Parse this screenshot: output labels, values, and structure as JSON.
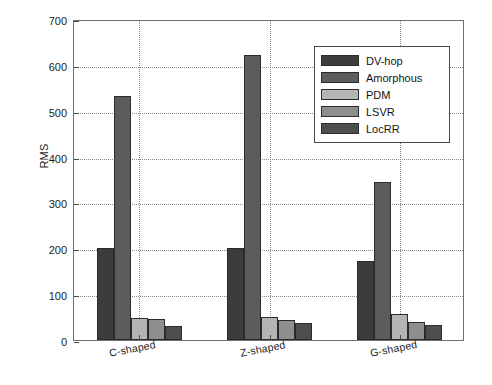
{
  "chart_data": {
    "type": "bar",
    "title": "",
    "xlabel": "",
    "ylabel": "RMS",
    "categories": [
      "C-shaped",
      "Z-shaped",
      "G-shaped"
    ],
    "series": [
      {
        "name": "DV-hop",
        "color": "#3c3c3c",
        "values": [
          201,
          201,
          172
        ]
      },
      {
        "name": "Amorphous",
        "color": "#5c5c5c",
        "values": [
          533,
          622,
          344
        ]
      },
      {
        "name": "PDM",
        "color": "#b4b4b4",
        "values": [
          48,
          51,
          57
        ]
      },
      {
        "name": "LSVR",
        "color": "#8e8e8e",
        "values": [
          45,
          44,
          39
        ]
      },
      {
        "name": "LocRR",
        "color": "#4e4e4e",
        "values": [
          30,
          38,
          32
        ]
      }
    ],
    "ylim": [
      0,
      700
    ],
    "yticks": [
      0,
      100,
      200,
      300,
      400,
      500,
      600,
      700
    ],
    "ytick_labels": [
      "0",
      "100",
      "200",
      "300",
      "400",
      "500",
      "600",
      "700"
    ],
    "grid": "dotted-both",
    "legend_position": "upper-right",
    "legend_entries": [
      "DV-hop",
      "Amorphous",
      "PDM",
      "LSVR",
      "LocRR"
    ]
  },
  "axes": {
    "y_title": "RMS"
  }
}
